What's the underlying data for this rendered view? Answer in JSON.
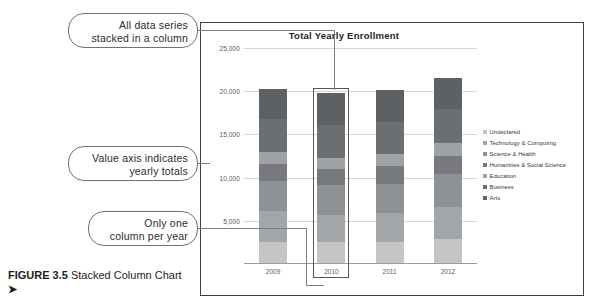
{
  "figure": {
    "number_label": "FIGURE 3.5",
    "title": "Stacked Column Chart",
    "arrow": "➤"
  },
  "callouts": {
    "series": {
      "line1": "All data series",
      "line2": "stacked in a column"
    },
    "axis": {
      "line1": "Value axis indicates",
      "line2": "yearly totals"
    },
    "column": {
      "line1": "Only one",
      "line2": "column per year"
    }
  },
  "chart_data": {
    "type": "bar",
    "subtype": "stacked-column",
    "title": "Total Yearly Enrollment",
    "xlabel": "",
    "ylabel": "",
    "categories": [
      "2009",
      "2010",
      "2011",
      "2012"
    ],
    "ylim": [
      0,
      25000
    ],
    "yticks": [
      0,
      5000,
      10000,
      15000,
      20000,
      25000
    ],
    "ytick_labels": [
      "",
      "5,000",
      "10,000",
      "15,000",
      "20,000",
      "25,000"
    ],
    "grid": true,
    "legend_position": "right",
    "series": [
      {
        "name": "Undeclared",
        "color": "#c3c5c7",
        "values": [
          2600,
          2500,
          2500,
          2900
        ]
      },
      {
        "name": "Technology & Computing",
        "color": "#a3a6a9",
        "values": [
          3500,
          3200,
          3400,
          3700
        ]
      },
      {
        "name": "Science & Health",
        "color": "#8f9295",
        "values": [
          3500,
          3400,
          3400,
          3800
        ]
      },
      {
        "name": "Humanities & Social Science",
        "color": "#77797c",
        "values": [
          2000,
          1900,
          2000,
          2100
        ]
      },
      {
        "name": "Education",
        "color": "#9fa2a5",
        "values": [
          1400,
          1300,
          1400,
          1500
        ]
      },
      {
        "name": "Business",
        "color": "#6c6f72",
        "values": [
          3800,
          3800,
          3700,
          4000
        ]
      },
      {
        "name": "Arts",
        "color": "#5e6164",
        "values": [
          3500,
          3700,
          3700,
          3500
        ]
      }
    ],
    "totals": [
      20300,
      19800,
      20100,
      21500
    ]
  },
  "colors": {
    "frame": "#3e4145",
    "gridline": "#d4d6d8",
    "callout_border": "#6f7276",
    "leader": "#7b7e82",
    "text": "#33363a"
  }
}
